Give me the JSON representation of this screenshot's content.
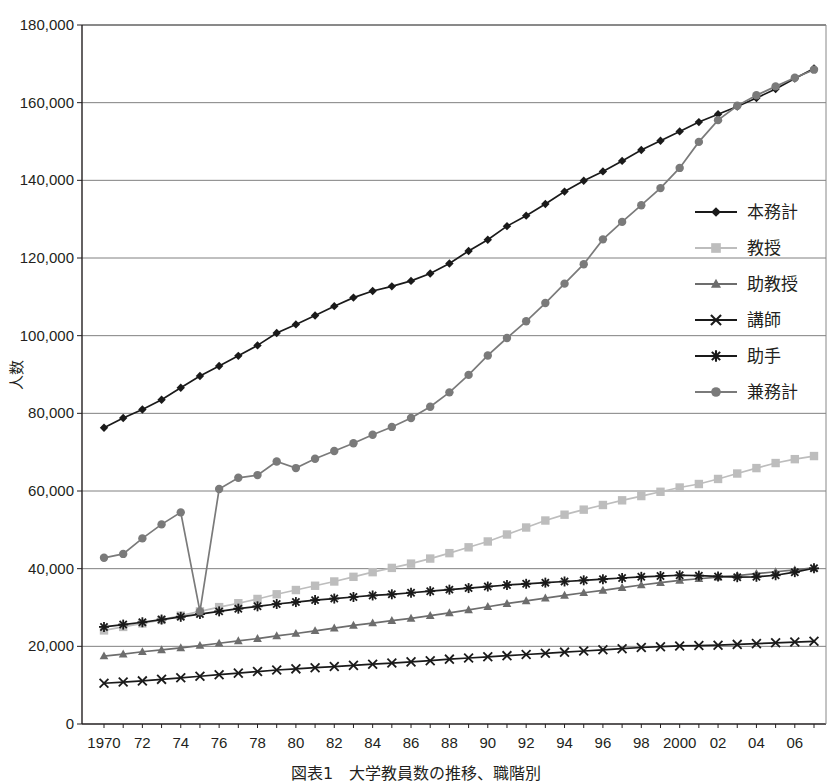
{
  "chart_data": {
    "type": "line",
    "xlabel": "",
    "ylabel": "人数",
    "ylim": [
      0,
      180000
    ],
    "ytick_step": 20000,
    "ytick_labels": [
      "0",
      "20,000",
      "40,000",
      "60,000",
      "80,000",
      "100,000",
      "120,000",
      "140,000",
      "160,000",
      "180,000"
    ],
    "grid": true,
    "legend_position": "right-inside",
    "x": [
      1970,
      1971,
      1972,
      1973,
      1974,
      1975,
      1976,
      1977,
      1978,
      1979,
      1980,
      1981,
      1982,
      1983,
      1984,
      1985,
      1986,
      1987,
      1988,
      1989,
      1990,
      1991,
      1992,
      1993,
      1994,
      1995,
      1996,
      1997,
      1998,
      1999,
      2000,
      2001,
      2002,
      2003,
      2004,
      2005,
      2006,
      2007
    ],
    "xtick_labels": [
      "1970",
      "",
      "72",
      "",
      "74",
      "",
      "76",
      "",
      "78",
      "",
      "80",
      "",
      "82",
      "",
      "84",
      "",
      "86",
      "",
      "88",
      "",
      "90",
      "",
      "92",
      "",
      "94",
      "",
      "96",
      "",
      "98",
      "",
      "2000",
      "",
      "02",
      "",
      "04",
      "",
      "06",
      ""
    ],
    "series": [
      {
        "name": "本務計",
        "marker": "diamond",
        "color": "#1a1a1a",
        "line_color": "#1a1a1a",
        "values": [
          76275,
          78800,
          81000,
          83500,
          86600,
          89600,
          92200,
          94800,
          97500,
          100700,
          102900,
          105200,
          107600,
          109800,
          111500,
          112700,
          114100,
          116000,
          118600,
          121800,
          124700,
          128200,
          130900,
          133900,
          137100,
          139900,
          142300,
          145000,
          147800,
          150200,
          152600,
          155000,
          157000,
          159000,
          161200,
          163500,
          166200,
          168800
        ]
      },
      {
        "name": "教授",
        "marker": "square",
        "color": "#bdbdbd",
        "line_color": "#bdbdbd",
        "values": [
          24100,
          25000,
          25900,
          26800,
          27900,
          29000,
          30100,
          31100,
          32200,
          33400,
          34500,
          35600,
          36700,
          37900,
          39100,
          40200,
          41300,
          42600,
          44000,
          45500,
          47000,
          48800,
          50600,
          52400,
          53900,
          55200,
          56400,
          57600,
          58700,
          59800,
          60900,
          61800,
          63100,
          64500,
          65900,
          67200,
          68200,
          69000
        ]
      },
      {
        "name": "助教授",
        "marker": "triangle",
        "color": "#6d6d6d",
        "line_color": "#6d6d6d",
        "values": [
          17500,
          18000,
          18600,
          19100,
          19600,
          20200,
          20800,
          21400,
          22000,
          22700,
          23300,
          24000,
          24700,
          25400,
          26000,
          26600,
          27200,
          27900,
          28600,
          29400,
          30200,
          31000,
          31700,
          32400,
          33100,
          33800,
          34400,
          35100,
          35800,
          36400,
          37000,
          37400,
          37800,
          38200,
          38700,
          39200,
          39700,
          40200
        ]
      },
      {
        "name": "講師",
        "marker": "x",
        "color": "#1a1a1a",
        "line_color": "#1a1a1a",
        "values": [
          10500,
          10800,
          11100,
          11500,
          11900,
          12300,
          12700,
          13100,
          13500,
          13900,
          14200,
          14500,
          14800,
          15100,
          15400,
          15700,
          16000,
          16300,
          16700,
          17000,
          17300,
          17600,
          17900,
          18200,
          18500,
          18800,
          19100,
          19400,
          19700,
          19900,
          20100,
          20200,
          20300,
          20500,
          20700,
          20900,
          21100,
          21300
        ]
      },
      {
        "name": "助手",
        "marker": "star",
        "color": "#1a1a1a",
        "line_color": "#1a1a1a",
        "values": [
          25000,
          25600,
          26200,
          26900,
          27600,
          28300,
          29000,
          29700,
          30300,
          30900,
          31400,
          31900,
          32300,
          32700,
          33100,
          33400,
          33800,
          34200,
          34600,
          35000,
          35400,
          35800,
          36100,
          36400,
          36700,
          37000,
          37300,
          37600,
          37900,
          38100,
          38300,
          38200,
          38000,
          37800,
          37900,
          38300,
          39100,
          40100
        ]
      },
      {
        "name": "兼務計",
        "marker": "circle",
        "color": "#7a7a7a",
        "line_color": "#7a7a7a",
        "values": [
          42800,
          43800,
          47800,
          51400,
          54500,
          29000,
          60500,
          63400,
          64100,
          67600,
          65900,
          68300,
          70300,
          72300,
          74500,
          76500,
          78800,
          81700,
          85400,
          89900,
          94900,
          99400,
          103700,
          108400,
          113400,
          118400,
          124800,
          129300,
          133600,
          138000,
          143200,
          149900,
          155500,
          159200,
          161900,
          164200,
          166400,
          168500
        ]
      }
    ]
  },
  "legend": {
    "items": [
      {
        "label": "本務計"
      },
      {
        "label": "教授"
      },
      {
        "label": "助教授"
      },
      {
        "label": "講師"
      },
      {
        "label": "助手"
      },
      {
        "label": "兼務計"
      }
    ]
  },
  "caption": "図表1　大学教員数の推移、職階別"
}
